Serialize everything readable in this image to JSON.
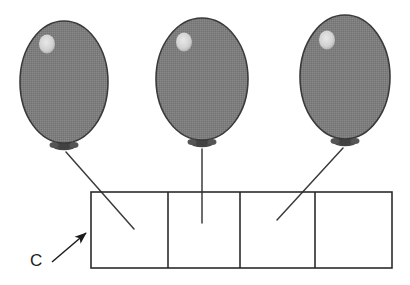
{
  "figure": {
    "background_color": "#ffffff",
    "width": 410,
    "height": 285,
    "annotations": [
      {
        "id": "callout-c",
        "label": "C",
        "label_x": 30,
        "label_y": 266,
        "arrow_tail_x": 52,
        "arrow_tail_y": 262,
        "arrow_head_x": 88,
        "arrow_head_y": 231,
        "points_to": "box-row-left-edge",
        "color": "#1c1c1c"
      }
    ],
    "colors": {
      "balloon_fill": "#7d7d7d",
      "balloon_stroke": "#3a3a3a",
      "balloon_highlight": "#d8d8d8",
      "knot_fill": "#4a4a4a",
      "string_stroke": "#3c3c3c",
      "box_stroke": "#2b2b2b",
      "box_fill": "#ffffff",
      "label_color": "#1c1c1c"
    },
    "balloons": [
      {
        "id": "balloon-1",
        "cx": 64,
        "cy": 82,
        "rx": 44,
        "ry": 61,
        "highlight_cx": 47,
        "highlight_cy": 44,
        "highlight_r": 8,
        "knot_x": 64,
        "knot_y": 146,
        "string_x1": 66,
        "string_y1": 152,
        "string_x2": 134,
        "string_y2": 229,
        "attached_cell": 1
      },
      {
        "id": "balloon-2",
        "cx": 202,
        "cy": 79,
        "rx": 46,
        "ry": 61,
        "highlight_cx": 184,
        "highlight_cy": 42,
        "highlight_r": 8,
        "knot_x": 202,
        "knot_y": 143,
        "string_x1": 202,
        "string_y1": 149,
        "string_x2": 202,
        "string_y2": 223,
        "attached_cell": 2
      },
      {
        "id": "balloon-3",
        "cx": 345,
        "cy": 77,
        "rx": 45,
        "ry": 62,
        "highlight_cx": 327,
        "highlight_cy": 40,
        "highlight_r": 8,
        "knot_x": 345,
        "knot_y": 142,
        "string_x1": 343,
        "string_y1": 148,
        "string_x2": 277,
        "string_y2": 220,
        "attached_cell": 3
      }
    ],
    "box_row": {
      "id": "box-row",
      "x": 91,
      "y": 192,
      "width": 301,
      "height": 76,
      "cell_count": 4,
      "dividers": [
        168,
        240,
        315
      ],
      "cells": [
        {
          "id": "cell-1",
          "label": ""
        },
        {
          "id": "cell-2",
          "label": ""
        },
        {
          "id": "cell-3",
          "label": ""
        },
        {
          "id": "cell-4",
          "label": ""
        }
      ]
    }
  }
}
